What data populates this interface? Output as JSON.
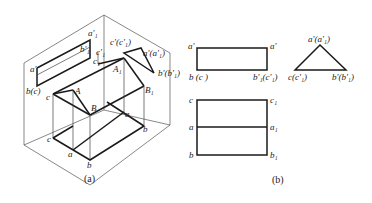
{
  "figure": {
    "subfigure_a": {
      "caption": "(a)",
      "labels": {
        "a1_prime": "a'₁",
        "b1_prime": "b'₁",
        "c1_prime": "c'₁",
        "c1": "c₁",
        "c_prime_c1_prime": "c'(c'₁)",
        "a_prime_a1_prime": "a'(a'₁)",
        "b_prime_b1_prime": "b'(b'₁)",
        "a_prime": "a'",
        "b_c": "b(c)",
        "A1": "A₁",
        "A": "A",
        "B1": "B₁",
        "B": "B",
        "c_upper": "c",
        "c_lower": "c",
        "a_right": "a",
        "b_right": "b",
        "a_lower": "a",
        "b_lower": "b"
      }
    },
    "subfigure_b": {
      "caption": "(b)",
      "front_view": {
        "top_left": "a'",
        "top_right": "a'",
        "bottom_left": "b (c )",
        "bottom_right": "b'₁(c'₁)"
      },
      "side_view": {
        "apex": "a'(a'₁)",
        "left": "c(c'₁)",
        "right": "b'(b'₁)"
      },
      "top_view": {
        "c": "c",
        "c1": "c₁",
        "a": "a",
        "a1": "a₁",
        "b": "b",
        "b1": "b₁"
      }
    }
  }
}
